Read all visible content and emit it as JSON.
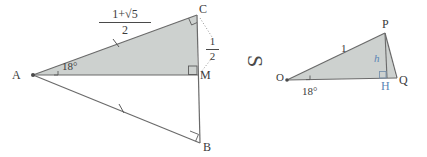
{
  "figure": {
    "kind": "geometry-diagram",
    "background_color": "#ffffff",
    "fill_color": "#cdd1cf",
    "stroke_color": "#6a6a6a",
    "label_color": "#3b3b3b",
    "accent_color": "#5b86b5",
    "separator_glyph": "S"
  },
  "left_triangle": {
    "name": "isosceles-triangle-ACB",
    "vertices": {
      "a": "A",
      "c": "C",
      "b": "B",
      "m": "M"
    },
    "angle_at_a": "18°",
    "side_ac_label": {
      "numerator": "1+√5",
      "denominator": "2"
    },
    "segment_cm_label": {
      "numerator": "1",
      "denominator": "2"
    },
    "right_angle_marks": [
      "C",
      "M",
      "B"
    ],
    "tick_marks": [
      "AC",
      "AB"
    ]
  },
  "right_triangle": {
    "name": "right-triangle-OPQ",
    "vertices": {
      "o": "O",
      "p": "P",
      "q": "Q",
      "h": "H"
    },
    "angle_at_o": "18°",
    "hypotenuse_label": "1",
    "height_label": "h",
    "right_angle_marks": [
      "H"
    ]
  }
}
